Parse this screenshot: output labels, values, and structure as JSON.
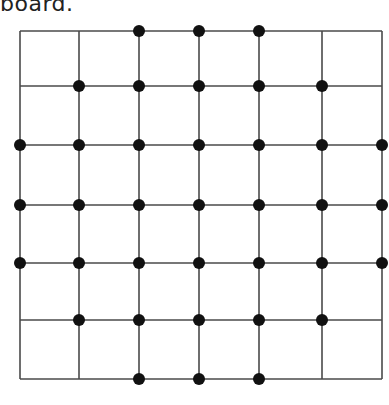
{
  "caption": {
    "text": "board."
  },
  "board": {
    "grid_size": 6,
    "columns_x": [
      20,
      79,
      139,
      199,
      259,
      322,
      382
    ],
    "rows_y": [
      31,
      86,
      145,
      205,
      263,
      320,
      379
    ],
    "line_color": "#4a4a4a",
    "dot_color": "#111111",
    "dot_radius": 6,
    "dots_by_row": [
      [
        2,
        3,
        4
      ],
      [
        1,
        2,
        3,
        4,
        5
      ],
      [
        0,
        1,
        2,
        3,
        4,
        5,
        6
      ],
      [
        0,
        1,
        2,
        3,
        4,
        5,
        6
      ],
      [
        0,
        1,
        2,
        3,
        4,
        5,
        6
      ],
      [
        1,
        2,
        3,
        4,
        5
      ],
      [
        2,
        3,
        4
      ]
    ],
    "total_dots": 33
  }
}
